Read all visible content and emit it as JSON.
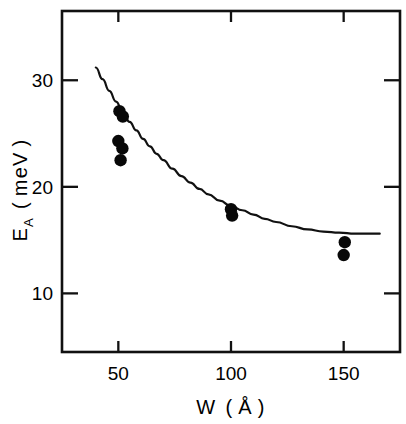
{
  "figure": {
    "background_color": "#ffffff",
    "ink_color": "#111111"
  },
  "chart_data": {
    "type": "scatter",
    "title": "",
    "subtitle": "",
    "xlabel": "W ( Å )",
    "xlabel_symbol": "W",
    "xlabel_unit": "Å",
    "ylabel": "E_A ( meV )",
    "ylabel_symbol": "E",
    "ylabel_subscript": "A",
    "ylabel_unit": "meV",
    "xlim": [
      25,
      175
    ],
    "ylim": [
      4.5,
      36.5
    ],
    "xticks": [
      50,
      100,
      150
    ],
    "xtick_labels": [
      "50",
      "100",
      "150"
    ],
    "yticks": [
      10,
      20,
      30
    ],
    "ytick_labels": [
      "10",
      "20",
      "30"
    ],
    "grid": false,
    "legend": null,
    "legend_position": "none",
    "ticks_on_all_sides": true,
    "series": [
      {
        "name": "measured",
        "marker": "filled-circle",
        "marker_color": "#080808",
        "marker_size": 6.2,
        "points": [
          {
            "x": 50.5,
            "y": 27.1
          },
          {
            "x": 52.0,
            "y": 26.6
          },
          {
            "x": 50.0,
            "y": 24.3
          },
          {
            "x": 51.8,
            "y": 23.6
          },
          {
            "x": 51.0,
            "y": 22.5
          },
          {
            "x": 100.0,
            "y": 17.9
          },
          {
            "x": 100.5,
            "y": 17.3
          },
          {
            "x": 150.5,
            "y": 14.8
          },
          {
            "x": 150.0,
            "y": 13.6
          }
        ]
      },
      {
        "name": "theory",
        "marker": "none",
        "line_color": "#111111",
        "line_width": 2.2,
        "curve": [
          {
            "x": 40.0,
            "y": 31.2
          },
          {
            "x": 43.0,
            "y": 30.1
          },
          {
            "x": 46.0,
            "y": 29.0
          },
          {
            "x": 49.0,
            "y": 28.0
          },
          {
            "x": 52.0,
            "y": 27.0
          },
          {
            "x": 55.0,
            "y": 26.1
          },
          {
            "x": 58.0,
            "y": 25.3
          },
          {
            "x": 61.0,
            "y": 24.5
          },
          {
            "x": 64.0,
            "y": 23.8
          },
          {
            "x": 67.0,
            "y": 23.1
          },
          {
            "x": 70.0,
            "y": 22.5
          },
          {
            "x": 74.0,
            "y": 21.7
          },
          {
            "x": 78.0,
            "y": 21.0
          },
          {
            "x": 82.0,
            "y": 20.4
          },
          {
            "x": 86.0,
            "y": 19.8
          },
          {
            "x": 90.0,
            "y": 19.3
          },
          {
            "x": 95.0,
            "y": 18.7
          },
          {
            "x": 100.0,
            "y": 18.2
          },
          {
            "x": 105.0,
            "y": 17.8
          },
          {
            "x": 110.0,
            "y": 17.4
          },
          {
            "x": 115.0,
            "y": 17.0
          },
          {
            "x": 120.0,
            "y": 16.7
          },
          {
            "x": 127.0,
            "y": 16.3
          },
          {
            "x": 134.0,
            "y": 16.0
          },
          {
            "x": 141.0,
            "y": 15.8
          },
          {
            "x": 148.0,
            "y": 15.7
          },
          {
            "x": 155.0,
            "y": 15.6
          },
          {
            "x": 162.0,
            "y": 15.6
          },
          {
            "x": 166.0,
            "y": 15.6
          }
        ]
      }
    ]
  }
}
